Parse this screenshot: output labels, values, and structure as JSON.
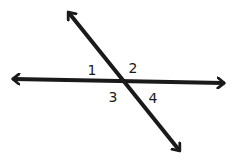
{
  "diagram": {
    "type": "intersecting-lines",
    "stroke_color": "#1a1a1a",
    "background_color": "#ffffff",
    "intersection": {
      "x": 122,
      "y": 80
    },
    "lines": [
      {
        "name": "horizontal-line",
        "start": {
          "x": 12,
          "y": 79
        },
        "end": {
          "x": 226,
          "y": 83
        },
        "arrowheads": [
          "start",
          "end"
        ]
      },
      {
        "name": "diagonal-line",
        "start": {
          "x": 67,
          "y": 11
        },
        "end": {
          "x": 181,
          "y": 152
        },
        "arrowheads": [
          "start",
          "end"
        ]
      }
    ],
    "angles": [
      {
        "label": "1",
        "position": "upper-left",
        "x": 92,
        "y": 70
      },
      {
        "label": "2",
        "position": "upper-right",
        "x": 133,
        "y": 68
      },
      {
        "label": "3",
        "position": "lower-left",
        "x": 113,
        "y": 97
      },
      {
        "label": "4",
        "position": "lower-right",
        "x": 153,
        "y": 98
      }
    ]
  }
}
